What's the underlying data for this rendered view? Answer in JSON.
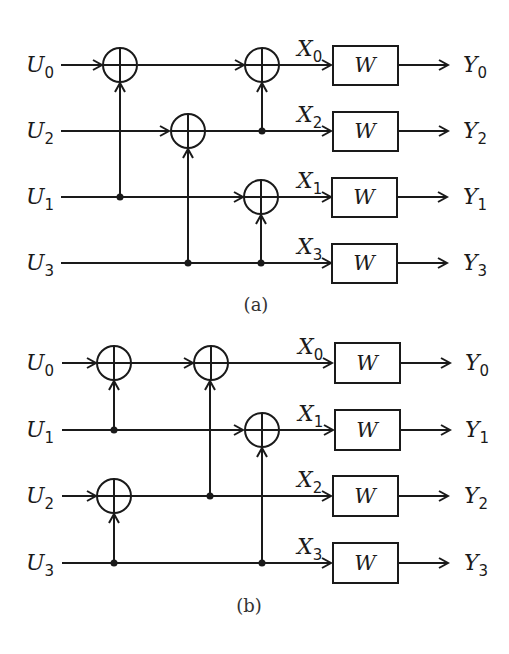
{
  "figure": {
    "panels": [
      {
        "id": "a",
        "caption": "(a)",
        "rows": [
          {
            "input": "U",
            "input_sub": "0",
            "mid": "X",
            "mid_sub": "0",
            "output": "Y",
            "output_sub": "0",
            "block": "W"
          },
          {
            "input": "U",
            "input_sub": "2",
            "mid": "X",
            "mid_sub": "2",
            "output": "Y",
            "output_sub": "2",
            "block": "W"
          },
          {
            "input": "U",
            "input_sub": "1",
            "mid": "X",
            "mid_sub": "1",
            "output": "Y",
            "output_sub": "1",
            "block": "W"
          },
          {
            "input": "U",
            "input_sub": "3",
            "mid": "X",
            "mid_sub": "3",
            "output": "Y",
            "output_sub": "3",
            "block": "W"
          }
        ]
      },
      {
        "id": "b",
        "caption": "(b)",
        "rows": [
          {
            "input": "U",
            "input_sub": "0",
            "mid": "X",
            "mid_sub": "0",
            "output": "Y",
            "output_sub": "0",
            "block": "W"
          },
          {
            "input": "U",
            "input_sub": "1",
            "mid": "X",
            "mid_sub": "1",
            "output": "Y",
            "output_sub": "1",
            "block": "W"
          },
          {
            "input": "U",
            "input_sub": "2",
            "mid": "X",
            "mid_sub": "2",
            "output": "Y",
            "output_sub": "2",
            "block": "W"
          },
          {
            "input": "U",
            "input_sub": "3",
            "mid": "X",
            "mid_sub": "3",
            "output": "Y",
            "output_sub": "3",
            "block": "W"
          }
        ]
      }
    ]
  }
}
